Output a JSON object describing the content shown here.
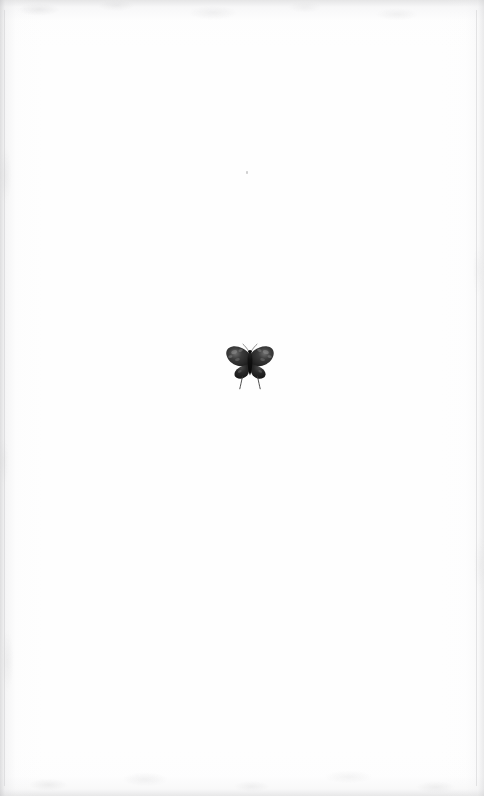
{
  "page": {
    "kind": "scanned-book-page",
    "width": 484,
    "height": 796,
    "paper_color": "#fefefe",
    "edge_shadow_color": "#c4c4c6",
    "border_rule_color": "#d0d0d2",
    "text": "",
    "caption": "",
    "page_number": ""
  },
  "figure": {
    "name": "butterfly",
    "body_color": "#171717",
    "wing_color": "#2e2e2e",
    "wing_shadow_color": "#4a4a4a",
    "wing_highlight_color": "#8d8d8d",
    "tail_color": "#3a3a3a",
    "position": {
      "left": 222,
      "top": 338,
      "width": 56,
      "height": 56
    }
  },
  "marks": {
    "speck": {
      "name": "paper-speck",
      "left": 246,
      "top": 171,
      "color": "#b0b0b2"
    }
  }
}
